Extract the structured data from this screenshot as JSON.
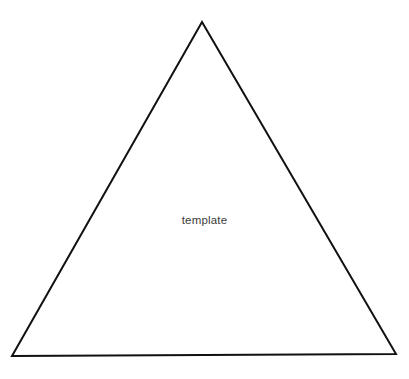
{
  "canvas": {
    "width": 409,
    "height": 379,
    "background_color": "#ffffff"
  },
  "figure": {
    "name": "triangle",
    "shape_type": "triangle",
    "stroke_color": "#111111",
    "stroke_width": 2,
    "fill": "none",
    "points": "202,22 396,354 12,356",
    "vertices": [
      {
        "label": "apex",
        "x": 202,
        "y": 22
      },
      {
        "label": "bottom-right",
        "x": 396,
        "y": 354
      },
      {
        "label": "bottom-left",
        "x": 12,
        "y": 356
      }
    ]
  },
  "label": {
    "text": "template",
    "color": "#3a3a3a",
    "font_size": 11.5,
    "center_x": 201,
    "center_y": 223
  }
}
